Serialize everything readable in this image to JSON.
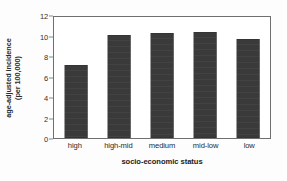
{
  "chart_data": {
    "type": "bar",
    "title": "",
    "subtitle": "",
    "categories": [
      "high",
      "high-mid",
      "medium",
      "mid-low",
      "low"
    ],
    "values": [
      7.1,
      10.05,
      10.25,
      10.3,
      9.65
    ],
    "series": [
      {
        "name": "age-adjusted incidence",
        "values": [
          7.1,
          10.05,
          10.25,
          10.3,
          9.65
        ]
      }
    ],
    "xlabel": "socio-economic status",
    "ylabel_line1": "age-adjusted incidence",
    "ylabel_line2": "(per 100,000)",
    "ylabel": "age-adjusted incidence (per 100,000)",
    "ylim": [
      0,
      12
    ],
    "yticks": [
      "12",
      "10",
      "8",
      "6",
      "4",
      "2",
      "0"
    ],
    "ytick_values": [
      12,
      10,
      8,
      6,
      4,
      2,
      0
    ],
    "grid": false,
    "legend": false,
    "legend_position": "none",
    "bar_color": "#3a3a3a",
    "frame_color": "#6f6f6f",
    "background_color": "#ffffff"
  }
}
